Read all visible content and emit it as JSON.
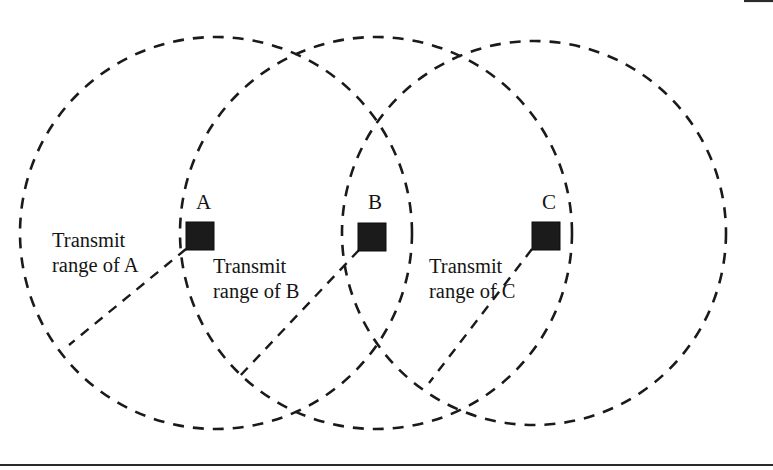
{
  "figure": {
    "kind": "wireless-transmit-range-diagram",
    "background_color": "#ffffff",
    "stroke_color": "#1a1a1a",
    "node_fill_color": "#1b1b1b",
    "width": 773,
    "height": 470
  },
  "nodes": [
    {
      "id": "A",
      "label": "A",
      "square": {
        "x": 186,
        "y": 222,
        "size": 28
      },
      "label_pos": {
        "x": 196,
        "y": 194
      }
    },
    {
      "id": "B",
      "label": "B",
      "square": {
        "x": 358,
        "y": 223,
        "size": 28
      },
      "label_pos": {
        "x": 368,
        "y": 194
      }
    },
    {
      "id": "C",
      "label": "C",
      "square": {
        "x": 532,
        "y": 222,
        "size": 28
      },
      "label_pos": {
        "x": 542,
        "y": 194
      }
    }
  ],
  "circles": [
    {
      "id": "range-A",
      "cx": 216,
      "cy": 233,
      "r": 196
    },
    {
      "id": "range-B",
      "cx": 376,
      "cy": 233,
      "r": 196
    },
    {
      "id": "range-C",
      "cx": 534,
      "cy": 233,
      "r": 192
    }
  ],
  "range_labels": [
    {
      "id": "range-label-a",
      "line1": "Transmit",
      "line2": "range of A",
      "x": 52,
      "y": 228,
      "leader": {
        "x1": 186,
        "y1": 249,
        "x2": 69,
        "y2": 345
      }
    },
    {
      "id": "range-label-b",
      "line1": "Transmit",
      "line2": "range of B",
      "x": 213,
      "y": 254,
      "leader": {
        "x1": 359,
        "y1": 250,
        "x2": 238,
        "y2": 378
      }
    },
    {
      "id": "range-label-c",
      "line1": "Transmit",
      "line2": "range of C",
      "x": 429,
      "y": 254,
      "leader": {
        "x1": 532,
        "y1": 249,
        "x2": 429,
        "y2": 383
      }
    }
  ],
  "rules": [
    {
      "id": "bottom-rule",
      "x1": 0,
      "y1": 465,
      "x2": 773,
      "y2": 465,
      "width": 2.2
    },
    {
      "id": "top-right-rule-fragment",
      "x1": 744,
      "y1": 1,
      "x2": 773,
      "y2": 1,
      "width": 2.2
    }
  ]
}
